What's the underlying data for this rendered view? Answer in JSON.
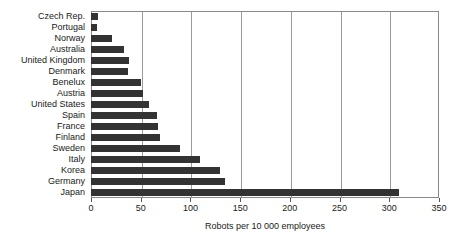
{
  "chart_data": {
    "type": "bar",
    "orientation": "horizontal",
    "title": "",
    "xlabel": "Robots per 10 000 employees",
    "ylabel": "",
    "xlim": [
      0,
      350
    ],
    "xticks": [
      0,
      50,
      100,
      150,
      200,
      250,
      300,
      350
    ],
    "xticklabels": [
      "0",
      "50",
      "100",
      "150",
      "200",
      "250",
      "300",
      "350"
    ],
    "grid": "vertical",
    "legend": "none",
    "bar_color": "#333333",
    "categories": [
      "Czech Rep.",
      "Portugal",
      "Norway",
      "Australia",
      "United Kingdom",
      "Denmark",
      "Benelux",
      "Austria",
      "United States",
      "Spain",
      "France",
      "Finland",
      "Sweden",
      "Italy",
      "Korea",
      "Germany",
      "Japan"
    ],
    "values": [
      7,
      6,
      21,
      33,
      38,
      37,
      50,
      52,
      58,
      66,
      67,
      69,
      90,
      110,
      130,
      135,
      310
    ]
  }
}
